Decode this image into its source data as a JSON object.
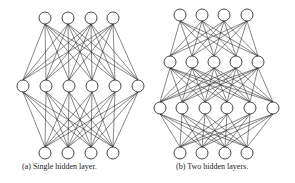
{
  "figure": {
    "panels": [
      {
        "id": "a",
        "caption": "(a) Single hidden layer.",
        "node_radius": 6,
        "layers": [
          {
            "name": "input",
            "y": 18,
            "x": [
              45,
              68,
              91,
              113
            ]
          },
          {
            "name": "hidden-1",
            "y": 86,
            "x": [
              23,
              46,
              69,
              92,
              115,
              138
            ]
          },
          {
            "name": "output",
            "y": 153,
            "x": [
              45,
              68,
              91,
              113
            ]
          }
        ]
      },
      {
        "id": "b",
        "caption": "(b) Two hidden layers.",
        "node_radius": 6,
        "layers": [
          {
            "name": "input",
            "y": 15,
            "x": [
              180,
              202,
              224,
              247
            ]
          },
          {
            "name": "hidden-1",
            "y": 62,
            "x": [
              170,
              192,
              214,
              236,
              258
            ]
          },
          {
            "name": "hidden-2",
            "y": 108,
            "x": [
              160,
              182,
              205,
              227,
              250,
              273
            ]
          },
          {
            "name": "output",
            "y": 153,
            "x": [
              180,
              202,
              225,
              247
            ]
          }
        ]
      }
    ]
  }
}
